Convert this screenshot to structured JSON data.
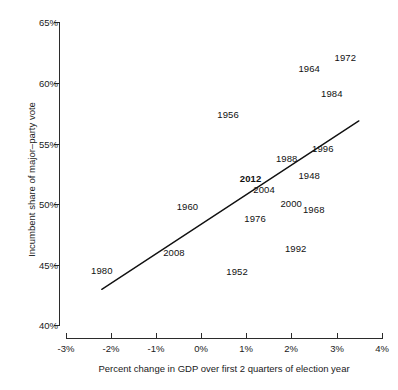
{
  "chart_data": {
    "type": "scatter",
    "title": "",
    "xlabel": "Percent change in GDP over first 2 quarters of election year",
    "ylabel": "Incumbent share of major–party vote",
    "xlim": [
      -3,
      4
    ],
    "ylim": [
      40,
      65
    ],
    "xticks": [
      "-3%",
      "-2%",
      "-1%",
      "0%",
      "1%",
      "2%",
      "3%",
      "4%"
    ],
    "xtick_values": [
      -3,
      -2,
      -1,
      0,
      1,
      2,
      3,
      4
    ],
    "yticks": [
      "40%",
      "45%",
      "50%",
      "55%",
      "60%",
      "65%"
    ],
    "ytick_values": [
      40,
      45,
      50,
      55,
      60,
      65
    ],
    "grid": false,
    "legend": null,
    "point_label_mode": "year-text-only",
    "points": [
      {
        "label": "1972",
        "x": 3.2,
        "y": 62.2,
        "highlight": false
      },
      {
        "label": "1964",
        "x": 2.4,
        "y": 61.3,
        "highlight": false
      },
      {
        "label": "1984",
        "x": 2.9,
        "y": 59.2,
        "highlight": false
      },
      {
        "label": "1956",
        "x": 0.6,
        "y": 57.5,
        "highlight": false
      },
      {
        "label": "1996",
        "x": 2.7,
        "y": 54.7,
        "highlight": false
      },
      {
        "label": "1988",
        "x": 1.9,
        "y": 53.8,
        "highlight": false
      },
      {
        "label": "1948",
        "x": 2.4,
        "y": 52.4,
        "highlight": false
      },
      {
        "label": "2012",
        "x": 1.1,
        "y": 52.2,
        "highlight": true
      },
      {
        "label": "2004",
        "x": 1.4,
        "y": 51.3,
        "highlight": false
      },
      {
        "label": "2000",
        "x": 2.0,
        "y": 50.1,
        "highlight": false
      },
      {
        "label": "1968",
        "x": 2.5,
        "y": 49.6,
        "highlight": false
      },
      {
        "label": "1960",
        "x": -0.3,
        "y": 49.9,
        "highlight": false
      },
      {
        "label": "1976",
        "x": 1.2,
        "y": 48.9,
        "highlight": false
      },
      {
        "label": "1992",
        "x": 2.1,
        "y": 46.4,
        "highlight": false
      },
      {
        "label": "2008",
        "x": -0.6,
        "y": 46.1,
        "highlight": false
      },
      {
        "label": "1980",
        "x": -2.2,
        "y": 44.6,
        "highlight": false
      },
      {
        "label": "1952",
        "x": 0.8,
        "y": 44.5,
        "highlight": false
      }
    ],
    "trend_line": {
      "x_start": -2.2,
      "y_start": 43.0,
      "x_end": 3.5,
      "y_end": 56.9
    }
  },
  "labels": {
    "y_axis_title": "Incumbent share of major–party vote",
    "x_axis_title": "Percent change in GDP over first 2 quarters of election year"
  }
}
